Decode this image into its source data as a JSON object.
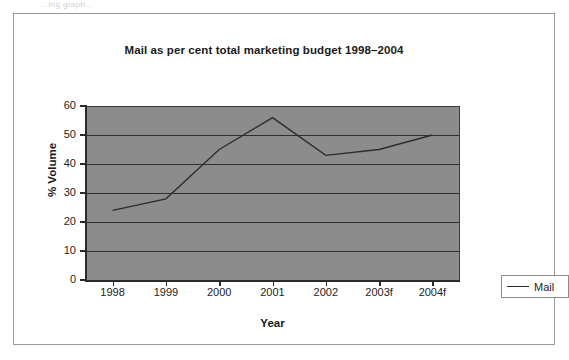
{
  "scan_artifact_text": "…ing graph…",
  "chart_data": {
    "type": "line",
    "title": "Mail as per cent total marketing budget 1998–2004",
    "xlabel": "Year",
    "ylabel": "% Volume",
    "categories": [
      "1998",
      "1999",
      "2000",
      "2001",
      "2002",
      "2003f",
      "2004f"
    ],
    "series": [
      {
        "name": "Mail",
        "values": [
          24,
          28,
          45,
          56,
          43,
          45,
          50
        ]
      }
    ],
    "ylim": [
      0,
      60
    ],
    "ytick_labels": [
      "60",
      "50",
      "40",
      "30",
      "20",
      "10",
      "0"
    ],
    "ytick_values": [
      60,
      50,
      40,
      30,
      20,
      10,
      0
    ],
    "ytick_step": 10,
    "grid": "horizontal",
    "legend_position": "right",
    "plot_background_color": "#8c8c8c",
    "series_color": "#2b2b2b",
    "axis_color": "#2b2b2b",
    "gridline_color": "#2f2f2f",
    "figure_background_color": "#ffffff",
    "frame_color": "#9a9a9a"
  },
  "legend": {
    "entries": [
      {
        "label": "Mail",
        "marker": "line-swatch"
      }
    ]
  }
}
